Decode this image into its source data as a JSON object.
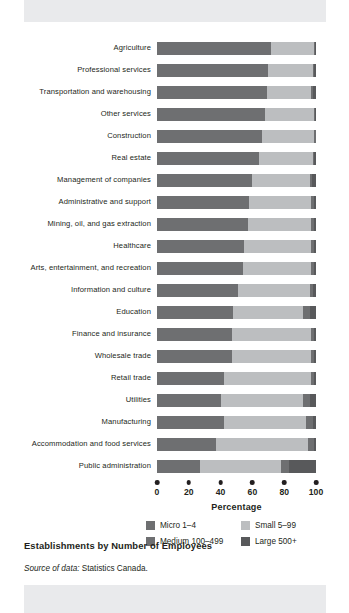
{
  "figure": {
    "title": "Establishments by Number of Employees",
    "source_prefix": "Source of data:",
    "source_value": "Statistics Canada."
  },
  "colors": {
    "micro": "#6e6f71",
    "small": "#bcbec0",
    "medium": "#6e6f71",
    "large": "#58595b",
    "text": "#231f20",
    "band": "#e9eaec",
    "page": "#ffffff"
  },
  "chart_data": {
    "type": "bar",
    "orientation": "horizontal",
    "stacked": true,
    "stacked_normalized": true,
    "title": "Establishments by Number of Employees",
    "xlabel": "Percentage",
    "ylabel": "",
    "xlim": [
      0,
      100
    ],
    "xticks": [
      0,
      20,
      40,
      60,
      80,
      100
    ],
    "xtick_labels": [
      "0",
      "20",
      "40",
      "60",
      "80",
      "100"
    ],
    "grid": false,
    "legend_position": "below-axis",
    "categories": [
      "Agriculture",
      "Professional services",
      "Transportation and warehousing",
      "Other services",
      "Construction",
      "Real estate",
      "Management of companies",
      "Administrative and support",
      "Mining, oil, and gas extraction",
      "Healthcare",
      "Arts, entertainment, and recreation",
      "Information and culture",
      "Education",
      "Finance and insurance",
      "Wholesale trade",
      "Retail trade",
      "Utilities",
      "Manufacturing",
      "Accommodation and food services",
      "Public administration"
    ],
    "series": [
      {
        "name": "Micro 1–4",
        "color": "#6e6f71",
        "values": [
          72,
          70,
          69,
          68,
          66,
          64,
          60,
          58,
          57,
          55,
          54,
          51,
          48,
          47,
          47,
          42,
          40,
          42,
          37,
          27
        ]
      },
      {
        "name": "Small 5–99",
        "color": "#bcbec0",
        "values": [
          27,
          28,
          28,
          31,
          33,
          34,
          36,
          39,
          40,
          42,
          43,
          45,
          44,
          50,
          50,
          55,
          52,
          52,
          58,
          51
        ]
      },
      {
        "name": "Medium 100–499",
        "color": "#6e6f71",
        "values": [
          0.6,
          0.7,
          1.2,
          0.6,
          0.7,
          1.0,
          1.4,
          1.6,
          1.6,
          2.0,
          1.8,
          2.0,
          4.0,
          1.6,
          1.8,
          1.8,
          4.0,
          4.0,
          3.5,
          5.0
        ]
      },
      {
        "name": "Large 500+",
        "color": "#58595b",
        "values": [
          0.4,
          1.3,
          1.8,
          0.4,
          0.3,
          1.0,
          2.6,
          1.4,
          1.4,
          1.0,
          1.2,
          2.0,
          4.0,
          1.4,
          1.2,
          1.2,
          4.0,
          2.0,
          1.5,
          17.0
        ]
      }
    ],
    "legend_entries": [
      "Micro 1–4",
      "Small 5–99",
      "Medium 100–499",
      "Large 500+"
    ]
  }
}
